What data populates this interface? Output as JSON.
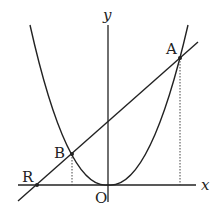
{
  "diagram": {
    "axes": {
      "x_label": "x",
      "y_label": "y",
      "origin_label": "O"
    },
    "points": [
      {
        "name": "A",
        "label": "A",
        "px": [
          180,
          58
        ]
      },
      {
        "name": "B",
        "label": "B",
        "px": [
          72,
          154
        ]
      },
      {
        "name": "R",
        "label": "R",
        "px": [
          37,
          185
        ]
      }
    ],
    "curves": [
      "parabola through O",
      "line through R, B, A"
    ],
    "colors": {
      "stroke": "#222222",
      "background": "#ffffff"
    }
  }
}
